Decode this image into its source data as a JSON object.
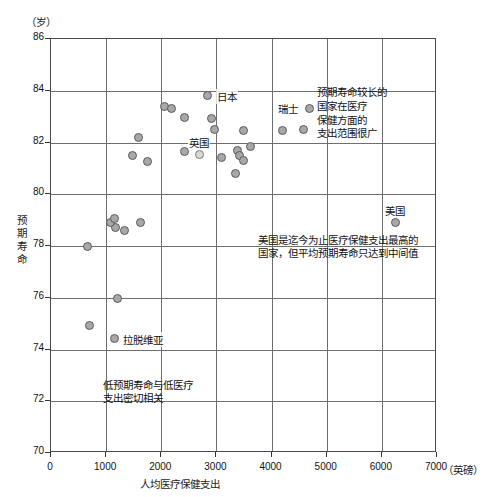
{
  "chart_data": {
    "type": "scatter",
    "title": "",
    "xlabel": "人均医疗保健支出",
    "ylabel": "预期寿命",
    "x_unit": "（英磅）",
    "y_unit": "（岁）",
    "xlim": [
      0,
      7000
    ],
    "ylim": [
      70,
      86
    ],
    "x_ticks": [
      "0",
      "1000",
      "2000",
      "3000",
      "4000",
      "5000",
      "6000",
      "7000"
    ],
    "x_tick_values": [
      0,
      1000,
      2000,
      3000,
      4000,
      5000,
      6000,
      7000
    ],
    "y_ticks": [
      "70",
      "72",
      "74",
      "76",
      "78",
      "80",
      "82",
      "84",
      "86"
    ],
    "y_tick_values": [
      70,
      72,
      74,
      76,
      78,
      80,
      82,
      84,
      86
    ],
    "grid": true,
    "legend": "none",
    "marker_color": "#a8a8a8",
    "marker_edge_color": "#5a5a5a",
    "highlight_color": "#d8d8d8",
    "points": [
      {
        "x": 1143,
        "y": 74.42,
        "label": "拉脱维亚",
        "label_pos": "right"
      },
      {
        "x": 690,
        "y": 74.92,
        "label": ""
      },
      {
        "x": 1215,
        "y": 75.97,
        "label": ""
      },
      {
        "x": 1324,
        "y": 78.58,
        "label": ""
      },
      {
        "x": 1161,
        "y": 78.7,
        "label": ""
      },
      {
        "x": 1088,
        "y": 78.92,
        "label": ""
      },
      {
        "x": 653,
        "y": 78.0,
        "label": ""
      },
      {
        "x": 1143,
        "y": 79.05,
        "label": ""
      },
      {
        "x": 1614,
        "y": 78.9,
        "label": ""
      },
      {
        "x": 1469,
        "y": 81.51,
        "label": ""
      },
      {
        "x": 1741,
        "y": 81.25,
        "label": ""
      },
      {
        "x": 1578,
        "y": 82.2,
        "label": ""
      },
      {
        "x": 2067,
        "y": 83.4,
        "label": ""
      },
      {
        "x": 2194,
        "y": 83.32,
        "label": ""
      },
      {
        "x": 2430,
        "y": 82.97,
        "label": ""
      },
      {
        "x": 2847,
        "y": 83.8,
        "label": "日本",
        "label_pos": "right"
      },
      {
        "x": 2919,
        "y": 82.93,
        "label": ""
      },
      {
        "x": 2974,
        "y": 82.52,
        "label": ""
      },
      {
        "x": 3499,
        "y": 82.48,
        "label": ""
      },
      {
        "x": 2430,
        "y": 81.67,
        "label": ""
      },
      {
        "x": 2684,
        "y": 81.52,
        "label": "英国",
        "label_pos": "above",
        "highlight": true
      },
      {
        "x": 3100,
        "y": 81.41,
        "label": ""
      },
      {
        "x": 3390,
        "y": 81.71,
        "label": ""
      },
      {
        "x": 3626,
        "y": 81.83,
        "label": ""
      },
      {
        "x": 3427,
        "y": 81.48,
        "label": ""
      },
      {
        "x": 3499,
        "y": 81.32,
        "label": ""
      },
      {
        "x": 3354,
        "y": 80.8,
        "label": ""
      },
      {
        "x": 4207,
        "y": 82.48,
        "label": ""
      },
      {
        "x": 4570,
        "y": 82.52,
        "label": ""
      },
      {
        "x": 4679,
        "y": 83.33,
        "label": "瑞士",
        "label_pos": "left"
      },
      {
        "x": 6239,
        "y": 78.89,
        "label": "美国",
        "label_pos": "above"
      }
    ],
    "annotations": [
      {
        "id": "annot-high-spend-range",
        "text": "预期寿命较长的\n国家在医疗\n保健方面的\n支出范围很广",
        "x": 4830,
        "y": 83.9
      },
      {
        "id": "annot-usa",
        "text": "美国是迄今为止医疗保健支出最高的\n国家，但平均预期寿命只达到中间值",
        "x": 3760,
        "y": 78.2
      },
      {
        "id": "annot-low-spend",
        "text": "低预期寿命与低医疗\n支出密切相关",
        "x": 950,
        "y": 72.6
      }
    ]
  }
}
